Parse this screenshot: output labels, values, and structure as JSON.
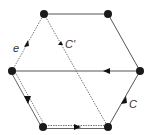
{
  "diagram": {
    "type": "hexagon-graph",
    "colors": {
      "vertex": "#1a1a1a",
      "solid_edge": "#555555",
      "dotted_edge": "#666666",
      "arrow": "#111111",
      "label": "#333333"
    },
    "vertices": [
      {
        "id": "top-left",
        "x": 44,
        "y": 14
      },
      {
        "id": "top-right",
        "x": 108,
        "y": 14
      },
      {
        "id": "left",
        "x": 12,
        "y": 71
      },
      {
        "id": "right",
        "x": 140,
        "y": 71
      },
      {
        "id": "bottom-left",
        "x": 43,
        "y": 127
      },
      {
        "id": "bottom-right",
        "x": 108,
        "y": 127
      }
    ],
    "labels": {
      "e": "e",
      "c_prime": "C'",
      "c": "C"
    },
    "edges": [
      {
        "from": "top-left",
        "to": "top-right",
        "style": "solid"
      },
      {
        "from": "top-right",
        "to": "right",
        "style": "solid"
      },
      {
        "from": "right",
        "to": "left",
        "style": "solid",
        "arrow": "toward left"
      },
      {
        "from": "bottom-right",
        "to": "right",
        "style": "solid",
        "arrow": "toward right",
        "label": "C"
      },
      {
        "from": "left",
        "to": "top-left",
        "style": "dotted",
        "arrow": "toward top-left",
        "label": "e"
      },
      {
        "from": "top-left",
        "to": "bottom-right",
        "style": "dotted",
        "arrow": "toward bottom-right",
        "label": "C'"
      },
      {
        "from": "left",
        "to": "bottom-left",
        "style": "double",
        "arrow": "toward bottom-left"
      },
      {
        "from": "bottom-left",
        "to": "bottom-right",
        "style": "double-dotted",
        "arrow": "toward bottom-right"
      }
    ]
  }
}
